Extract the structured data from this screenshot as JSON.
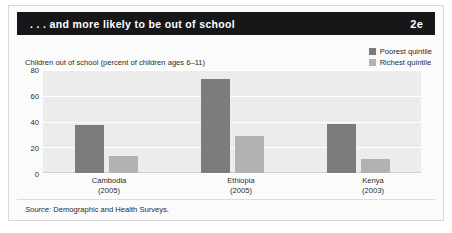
{
  "header": {
    "title": ". . . and more likely to be out of school",
    "code": "2e"
  },
  "source_note": {
    "prefix": "Source:",
    "text": "Demographic and Health Surveys."
  },
  "colors": {
    "poorest": "#7c7c7c",
    "richest": "#b2b2b2",
    "header_bg": "#17171a",
    "plot_bg": "#ececec",
    "gridline": "#ffffff"
  },
  "chart_data": {
    "type": "bar",
    "title": "Children out of school (percent of children ages 6–11)",
    "xlabel": "",
    "ylabel": "",
    "ylim": [
      0,
      80
    ],
    "yticks": [
      0,
      20,
      40,
      60,
      80
    ],
    "grid": true,
    "legend_position": "top-right",
    "categories": [
      "Cambodia",
      "Ethiopia",
      "Kenya"
    ],
    "category_years": [
      "(2005)",
      "(2005)",
      "(2003)"
    ],
    "series": [
      {
        "name": "Poorest quintile",
        "color": "#7c7c7c",
        "values": [
          37,
          73,
          38
        ]
      },
      {
        "name": "Richest quintile",
        "color": "#b2b2b2",
        "values": [
          13,
          29,
          11
        ]
      }
    ]
  }
}
